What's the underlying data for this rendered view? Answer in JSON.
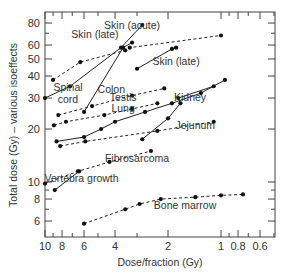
{
  "chart_data": {
    "type": "line",
    "title": "",
    "xlabel": "Dose/fraction (Gy)",
    "ylabel": "Total dose (Gy) – various isoeffects",
    "xscale": "log",
    "yscale": "log",
    "xlim": [
      10,
      0.5
    ],
    "ylim": [
      5,
      90
    ],
    "x_ticks": [
      10,
      8,
      6,
      4,
      2,
      1,
      0.8,
      0.6
    ],
    "y_ticks": [
      6,
      8,
      10,
      20,
      30,
      40,
      50,
      60,
      80
    ],
    "grid": false,
    "series": [
      {
        "name": "Skin (acute)",
        "style": "dashed",
        "label_at": [
          3.2,
          74
        ],
        "points": [
          [
            9.0,
            38
          ],
          [
            6.3,
            48
          ],
          [
            3.5,
            56
          ],
          [
            3.3,
            58
          ],
          [
            1.0,
            68
          ]
        ]
      },
      {
        "name": "Skin (late)",
        "style": "solid",
        "label_at": [
          5.2,
          66
        ],
        "points": [
          [
            10.0,
            30
          ],
          [
            7.2,
            35
          ],
          [
            3.7,
            58
          ],
          [
            2.8,
            78
          ]
        ]
      },
      {
        "name": "Skin (late)",
        "style": "solid",
        "label_at": [
          1.8,
          46
        ],
        "points": [
          [
            3.0,
            44
          ],
          [
            1.9,
            57
          ],
          [
            1.8,
            58
          ]
        ]
      },
      {
        "name": "Spinal cord",
        "style": "solid",
        "label_at": [
          7.4,
          33
        ],
        "points": [
          [
            6.0,
            25
          ],
          [
            3.6,
            58
          ],
          [
            3.2,
            62
          ]
        ]
      },
      {
        "name": "Colon",
        "style": "dashed",
        "label_at": [
          4.2,
          32
        ],
        "points": [
          [
            8.4,
            24
          ],
          [
            5.4,
            27
          ],
          [
            3.2,
            31
          ],
          [
            2.1,
            34
          ]
        ]
      },
      {
        "name": "Testis",
        "style": "dashed",
        "label_at": [
          3.6,
          29
        ],
        "points": [
          [
            8.9,
            21
          ],
          [
            7.6,
            22
          ],
          [
            4.6,
            24
          ],
          [
            3.2,
            26
          ],
          [
            2.3,
            28
          ]
        ]
      },
      {
        "name": "Lung",
        "style": "solid",
        "label_at": [
          3.6,
          25
        ],
        "points": [
          [
            8.6,
            17
          ],
          [
            6.0,
            18
          ],
          [
            4.8,
            20
          ],
          [
            4.0,
            22
          ],
          [
            2.7,
            25
          ],
          [
            1.9,
            28
          ],
          [
            1.3,
            32
          ],
          [
            0.95,
            38
          ]
        ]
      },
      {
        "name": "Kidney",
        "style": "solid",
        "label_at": [
          1.5,
          29
        ],
        "points": [
          [
            2.8,
            17.5
          ],
          [
            2.0,
            23
          ],
          [
            1.7,
            28
          ],
          [
            1.75,
            30
          ],
          [
            1.1,
            35
          ]
        ]
      },
      {
        "name": "Jejunum",
        "style": "dashed",
        "label_at": [
          1.4,
          20
        ],
        "points": [
          [
            8.2,
            16
          ],
          [
            5.9,
            17
          ],
          [
            2.3,
            19.5
          ],
          [
            1.1,
            22
          ]
        ]
      },
      {
        "name": "Fibrosarcoma",
        "style": "dashed",
        "label_at": [
          3.0,
          13
        ],
        "points": [
          [
            10.0,
            9.8
          ],
          [
            6.5,
            11.5
          ],
          [
            4.3,
            13
          ],
          [
            2.5,
            15
          ]
        ]
      },
      {
        "name": "Vertebra growth",
        "style": "solid",
        "label_at": [
          6.2,
          10
        ],
        "points": [
          [
            8.8,
            9.0
          ],
          [
            6.4,
            11.5
          ]
        ]
      },
      {
        "name": "Bone marrow",
        "style": "dashed",
        "label_at": [
          1.6,
          7.0
        ],
        "points": [
          [
            6.0,
            5.8
          ],
          [
            3.5,
            7.0
          ],
          [
            2.9,
            7.5
          ],
          [
            2.2,
            8.0
          ],
          [
            1.4,
            8.2
          ],
          [
            1.0,
            8.4
          ],
          [
            0.75,
            8.5
          ]
        ]
      }
    ]
  }
}
